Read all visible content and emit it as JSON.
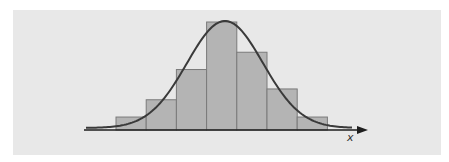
{
  "chart_data": {
    "type": "bar",
    "subtype": "histogram with normal curve overlay",
    "title": "",
    "xlabel": "x",
    "ylabel": "",
    "categories": [
      "bin1",
      "bin2",
      "bin3",
      "bin4",
      "bin5",
      "bin6",
      "bin7"
    ],
    "values": [
      1.2,
      2.8,
      5.6,
      10.0,
      7.2,
      3.8,
      1.2
    ],
    "series": [
      {
        "name": "histogram",
        "values": [
          1.2,
          2.8,
          5.6,
          10.0,
          7.2,
          3.8,
          1.2
        ]
      },
      {
        "name": "normal-curve",
        "kind": "line",
        "peak_position": "between bin4 center and left edge of bin5"
      }
    ],
    "tick_labels": [],
    "grid": false,
    "legend": null,
    "axes": {
      "x_arrow": true,
      "y_axis_visible": false
    }
  },
  "colors": {
    "background": "#e8e8e8",
    "bar_fill": "#b4b4b4",
    "bar_stroke": "#7a7a7a",
    "curve": "#3a3a3a",
    "axis": "#1e1e1e"
  },
  "labels": {
    "x_axis": "x"
  }
}
